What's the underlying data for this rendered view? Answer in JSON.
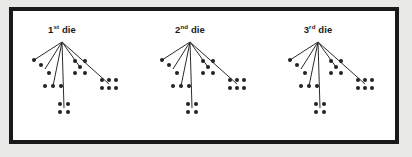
{
  "figure": {
    "background_color": "#ffffff",
    "frame_color": "#191919",
    "pip_color": "#222222",
    "branch_color": "#2b2b2b"
  },
  "chart_data": {
    "type": "diagram",
    "groups": [
      {
        "label_prefix": "1",
        "label_suffix": "st",
        "label_word": "die",
        "label_full": "1st die",
        "root": {
          "x": 62,
          "y": 42
        },
        "outcomes": [
          1,
          2,
          3,
          4,
          5,
          6
        ]
      },
      {
        "label_prefix": "2",
        "label_suffix": "nd",
        "label_word": "die",
        "label_full": "2nd die",
        "root": {
          "x": 190,
          "y": 42
        },
        "outcomes": [
          1,
          2,
          3,
          4,
          5,
          6
        ]
      },
      {
        "label_prefix": "3",
        "label_suffix": "rd",
        "label_word": "die",
        "label_full": "3rd die",
        "root": {
          "x": 318,
          "y": 42
        },
        "outcomes": [
          1,
          2,
          3,
          4,
          5,
          6
        ]
      }
    ],
    "face_endpoints": [
      {
        "face": 1,
        "dx": -28,
        "dy": 18
      },
      {
        "face": 2,
        "dx": -17,
        "dy": 27
      },
      {
        "face": 3,
        "dx": -9,
        "dy": 44
      },
      {
        "face": 4,
        "dx": 2,
        "dy": 66
      },
      {
        "face": 5,
        "dx": 18,
        "dy": 25
      },
      {
        "face": 6,
        "dx": 47,
        "dy": 42
      }
    ],
    "face_pip_layouts": {
      "1": [
        [
          0,
          0
        ]
      ],
      "2": [
        [
          -4,
          -4
        ],
        [
          4,
          4
        ]
      ],
      "3": [
        [
          -8,
          0
        ],
        [
          0,
          0
        ],
        [
          8,
          0
        ]
      ],
      "4": [
        [
          -4,
          -4
        ],
        [
          4,
          -4
        ],
        [
          -4,
          4
        ],
        [
          4,
          4
        ]
      ],
      "5": [
        [
          -5,
          -6
        ],
        [
          5,
          -6
        ],
        [
          0,
          0
        ],
        [
          -5,
          6
        ],
        [
          5,
          6
        ]
      ],
      "6": [
        [
          -7,
          -4
        ],
        [
          0,
          -4
        ],
        [
          7,
          -4
        ],
        [
          -7,
          4
        ],
        [
          0,
          4
        ],
        [
          7,
          4
        ]
      ]
    }
  }
}
